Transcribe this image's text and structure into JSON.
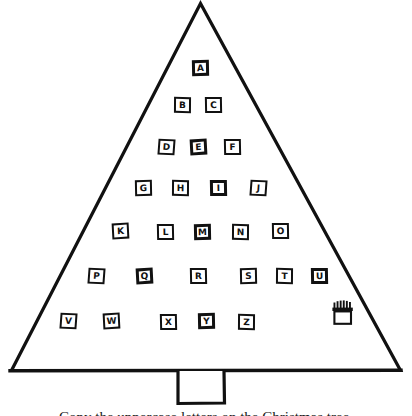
{
  "worksheet": {
    "title": "Alphabet Christmas Tree",
    "caption": "Copy the uppercase letters on the Christmas tree.",
    "ink_color": "#111111",
    "paper_color": "#ffffff"
  },
  "tree": {
    "shape": "triangle",
    "apex": {
      "x": 200,
      "y": 3
    },
    "base_left": {
      "x": 10,
      "y": 371
    },
    "base_right": {
      "x": 400,
      "y": 371
    },
    "outline_width": 3,
    "trunk": {
      "x": 177,
      "y": 371,
      "width": 48,
      "height": 33
    }
  },
  "ornaments": {
    "type": "letter-tiles",
    "alphabet": "uppercase",
    "count": 26,
    "rows": [
      {
        "row": 1,
        "tiles": [
          {
            "letter": "A",
            "x": 192,
            "y": 60
          }
        ]
      },
      {
        "row": 2,
        "tiles": [
          {
            "letter": "B",
            "x": 174,
            "y": 97
          },
          {
            "letter": "C",
            "x": 205,
            "y": 97
          }
        ]
      },
      {
        "row": 3,
        "tiles": [
          {
            "letter": "D",
            "x": 158,
            "y": 139
          },
          {
            "letter": "E",
            "x": 190,
            "y": 139
          },
          {
            "letter": "F",
            "x": 224,
            "y": 139
          }
        ]
      },
      {
        "row": 4,
        "tiles": [
          {
            "letter": "G",
            "x": 135,
            "y": 180
          },
          {
            "letter": "H",
            "x": 172,
            "y": 180
          },
          {
            "letter": "I",
            "x": 210,
            "y": 180
          },
          {
            "letter": "J",
            "x": 250,
            "y": 180
          }
        ]
      },
      {
        "row": 5,
        "tiles": [
          {
            "letter": "K",
            "x": 112,
            "y": 223
          },
          {
            "letter": "L",
            "x": 157,
            "y": 224
          },
          {
            "letter": "M",
            "x": 194,
            "y": 224
          },
          {
            "letter": "N",
            "x": 232,
            "y": 224
          },
          {
            "letter": "O",
            "x": 272,
            "y": 223
          }
        ]
      },
      {
        "row": 6,
        "tiles": [
          {
            "letter": "P",
            "x": 88,
            "y": 268
          },
          {
            "letter": "Q",
            "x": 136,
            "y": 268
          },
          {
            "letter": "R",
            "x": 190,
            "y": 268
          },
          {
            "letter": "S",
            "x": 240,
            "y": 268
          },
          {
            "letter": "T",
            "x": 276,
            "y": 268
          },
          {
            "letter": "U",
            "x": 311,
            "y": 268
          }
        ]
      },
      {
        "row": 7,
        "tiles": [
          {
            "letter": "V",
            "x": 60,
            "y": 313
          },
          {
            "letter": "W",
            "x": 103,
            "y": 313
          },
          {
            "letter": "X",
            "x": 160,
            "y": 314
          },
          {
            "letter": "Y",
            "x": 198,
            "y": 313
          },
          {
            "letter": "Z",
            "x": 238,
            "y": 314
          }
        ]
      }
    ]
  },
  "decoration": {
    "gift_basket": {
      "icon": "gift-basket-icon",
      "x": 331,
      "y": 300,
      "width": 24,
      "height": 26
    }
  }
}
